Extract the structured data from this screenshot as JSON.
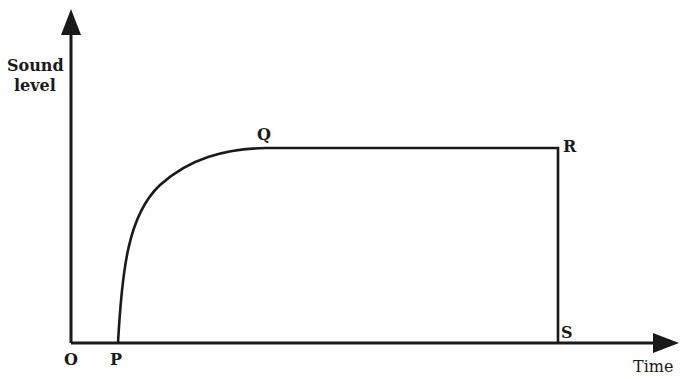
{
  "diagram": {
    "type": "sound-level-vs-time graph",
    "y_axis": {
      "label_line1": "Sound",
      "label_line2": "level"
    },
    "x_axis": {
      "label": "Time"
    },
    "points": {
      "origin": "O",
      "P": "P",
      "Q": "Q",
      "R": "R",
      "S": "S"
    },
    "segments": [
      {
        "from": "P",
        "to": "Q",
        "shape": "rising curve (rapid rise, levelling off)"
      },
      {
        "from": "Q",
        "to": "R",
        "shape": "horizontal constant level"
      },
      {
        "from": "R",
        "to": "S",
        "shape": "vertical drop to zero"
      }
    ],
    "colors": {
      "ink": "#1a1a1a",
      "background": "#ffffff"
    }
  }
}
